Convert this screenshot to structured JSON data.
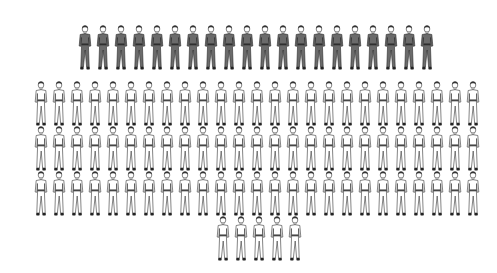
{
  "figure": {
    "colors": {
      "dark_fill": "#6b6b6b",
      "dark_stroke": "#2a2a2a",
      "light_fill": "#ffffff",
      "light_stroke": "#333333",
      "shoe": "#222222",
      "hair": "#333333",
      "background": "#ffffff"
    },
    "rows": [
      {
        "name": "dark-row",
        "style": "dark",
        "count": 20,
        "x0": 77,
        "y": 24,
        "step": 18
      },
      {
        "name": "light-row-1",
        "style": "light",
        "count": 25,
        "x0": 33,
        "y": 80,
        "step": 18
      },
      {
        "name": "light-row-2",
        "style": "light",
        "count": 25,
        "x0": 33,
        "y": 125,
        "step": 18
      },
      {
        "name": "light-row-3",
        "style": "light",
        "count": 25,
        "x0": 33,
        "y": 170,
        "step": 18
      },
      {
        "name": "light-row-4",
        "style": "light",
        "count": 5,
        "x0": 215,
        "y": 215,
        "step": 18
      }
    ],
    "totals": {
      "dark": 20,
      "light": 80,
      "all": 100
    }
  }
}
